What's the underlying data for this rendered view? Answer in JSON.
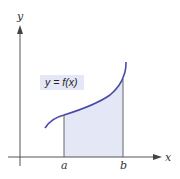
{
  "diagram": {
    "title": "",
    "axes": {
      "x_label": "x",
      "y_label": "y"
    },
    "curve_label": "y = f(x)",
    "bounds": {
      "a_label": "a",
      "b_label": "b"
    },
    "colors": {
      "curve": "#4a4aa8",
      "shaded_area": "#e4e8f6",
      "label_bg": "#e4e8f6",
      "axis": "#555555",
      "bound_lines": "#666666"
    }
  }
}
